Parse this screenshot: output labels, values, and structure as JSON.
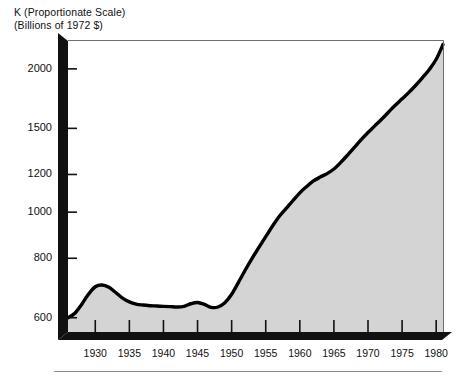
{
  "title": {
    "line1": "K (Proportionate Scale)",
    "line2": "(Billions of 1972 $)"
  },
  "colors": {
    "axis": "#111111",
    "curve": "#000000",
    "fill": "#d4d4d4",
    "background": "#ffffff",
    "rule": "#8a8a8a"
  },
  "chart_data": {
    "type": "area",
    "title": "K (Proportionate Scale)",
    "subtitle": "(Billions of 1972 $)",
    "xlabel": "",
    "ylabel": "K (Proportionate Scale) (Billions of 1972 $)",
    "yscale": "proportionate",
    "grid": false,
    "legend": false,
    "xlim": [
      1926,
      1981
    ],
    "ylim": [
      560,
      2300
    ],
    "ytick_labels": [
      "600",
      "800",
      "1000",
      "1200",
      "1500",
      "2000"
    ],
    "ytick_values": [
      600,
      800,
      1000,
      1200,
      1500,
      2000
    ],
    "xtick_labels": [
      "1930",
      "1935",
      "1940",
      "1945",
      "1950",
      "1955",
      "1960",
      "1965",
      "1970",
      "1975",
      "1980"
    ],
    "xtick_values": [
      1930,
      1935,
      1940,
      1945,
      1950,
      1955,
      1960,
      1965,
      1970,
      1975,
      1980
    ],
    "series": [
      {
        "name": "K",
        "x": [
          1926,
          1927,
          1928,
          1929,
          1930,
          1931,
          1932,
          1933,
          1934,
          1935,
          1936,
          1937,
          1938,
          1939,
          1940,
          1941,
          1942,
          1943,
          1944,
          1945,
          1946,
          1947,
          1948,
          1949,
          1950,
          1951,
          1952,
          1953,
          1954,
          1955,
          1956,
          1957,
          1958,
          1959,
          1960,
          1961,
          1962,
          1963,
          1964,
          1965,
          1966,
          1967,
          1968,
          1969,
          1970,
          1971,
          1972,
          1973,
          1974,
          1975,
          1976,
          1977,
          1978,
          1979,
          1980,
          1981
        ],
        "values": [
          600,
          613,
          640,
          672,
          697,
          703,
          695,
          678,
          660,
          648,
          641,
          638,
          636,
          635,
          634,
          633,
          632,
          634,
          642,
          646,
          640,
          631,
          632,
          645,
          672,
          712,
          756,
          800,
          843,
          888,
          935,
          980,
          1018,
          1058,
          1098,
          1132,
          1163,
          1185,
          1205,
          1232,
          1272,
          1318,
          1368,
          1420,
          1470,
          1518,
          1568,
          1622,
          1678,
          1730,
          1785,
          1848,
          1918,
          1995,
          2095,
          2250
        ]
      }
    ],
    "annotations": []
  },
  "axes": {
    "y_axis_name": "value-axis",
    "x_axis_name": "year-axis"
  }
}
